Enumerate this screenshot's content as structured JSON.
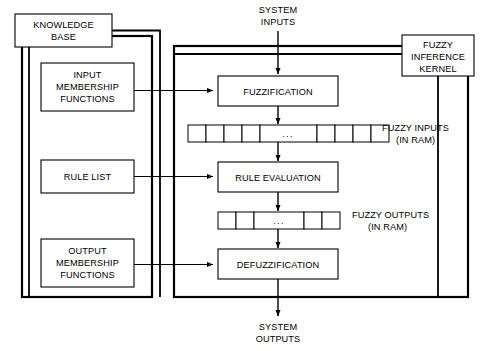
{
  "diagram": {
    "colors": {
      "background": "#ffffff",
      "stroke": "#000000",
      "box_fill": "#ffffff"
    },
    "containers": [
      {
        "id": "knowledge-base-container",
        "name": "knowledge-base-group"
      },
      {
        "id": "kernel-container",
        "name": "inference-kernel-group"
      }
    ],
    "knowledge_base": {
      "header_label_line1": "KNOWLEDGE",
      "header_label_line2": "BASE",
      "blocks": [
        {
          "id": "input-membership-functions",
          "lines": [
            "INPUT",
            "MEMBERSHIP",
            "FUNCTIONS"
          ]
        },
        {
          "id": "rule-list",
          "lines": [
            "RULE LIST"
          ]
        },
        {
          "id": "output-membership-functions",
          "lines": [
            "OUTPUT",
            "MEMBERSHIP",
            "FUNCTIONS"
          ]
        }
      ]
    },
    "kernel": {
      "badge_lines": [
        "FUZZY",
        "INFERENCE",
        "KERNEL"
      ],
      "processes": [
        {
          "id": "fuzzification",
          "label": "FUZZIFICATION"
        },
        {
          "id": "rule-evaluation",
          "label": "RULE EVALUATION"
        },
        {
          "id": "defuzzification",
          "label": "DEFUZZIFICATION"
        }
      ],
      "memory_arrays": [
        {
          "id": "fuzzy-inputs-array",
          "label_line1": "FUZZY INPUTS",
          "label_line2": "(IN RAM)",
          "cells_left": 4,
          "cells_right": 4,
          "ellipsis": "..."
        },
        {
          "id": "fuzzy-outputs-array",
          "label_line1": "FUZZY OUTPUTS",
          "label_line2": "(IN RAM)",
          "cells_left": 2,
          "cells_right": 2,
          "ellipsis": "..."
        }
      ]
    },
    "io": {
      "inputs_line1": "SYSTEM",
      "inputs_line2": "INPUTS",
      "outputs_line1": "SYSTEM",
      "outputs_line2": "OUTPUTS"
    }
  }
}
